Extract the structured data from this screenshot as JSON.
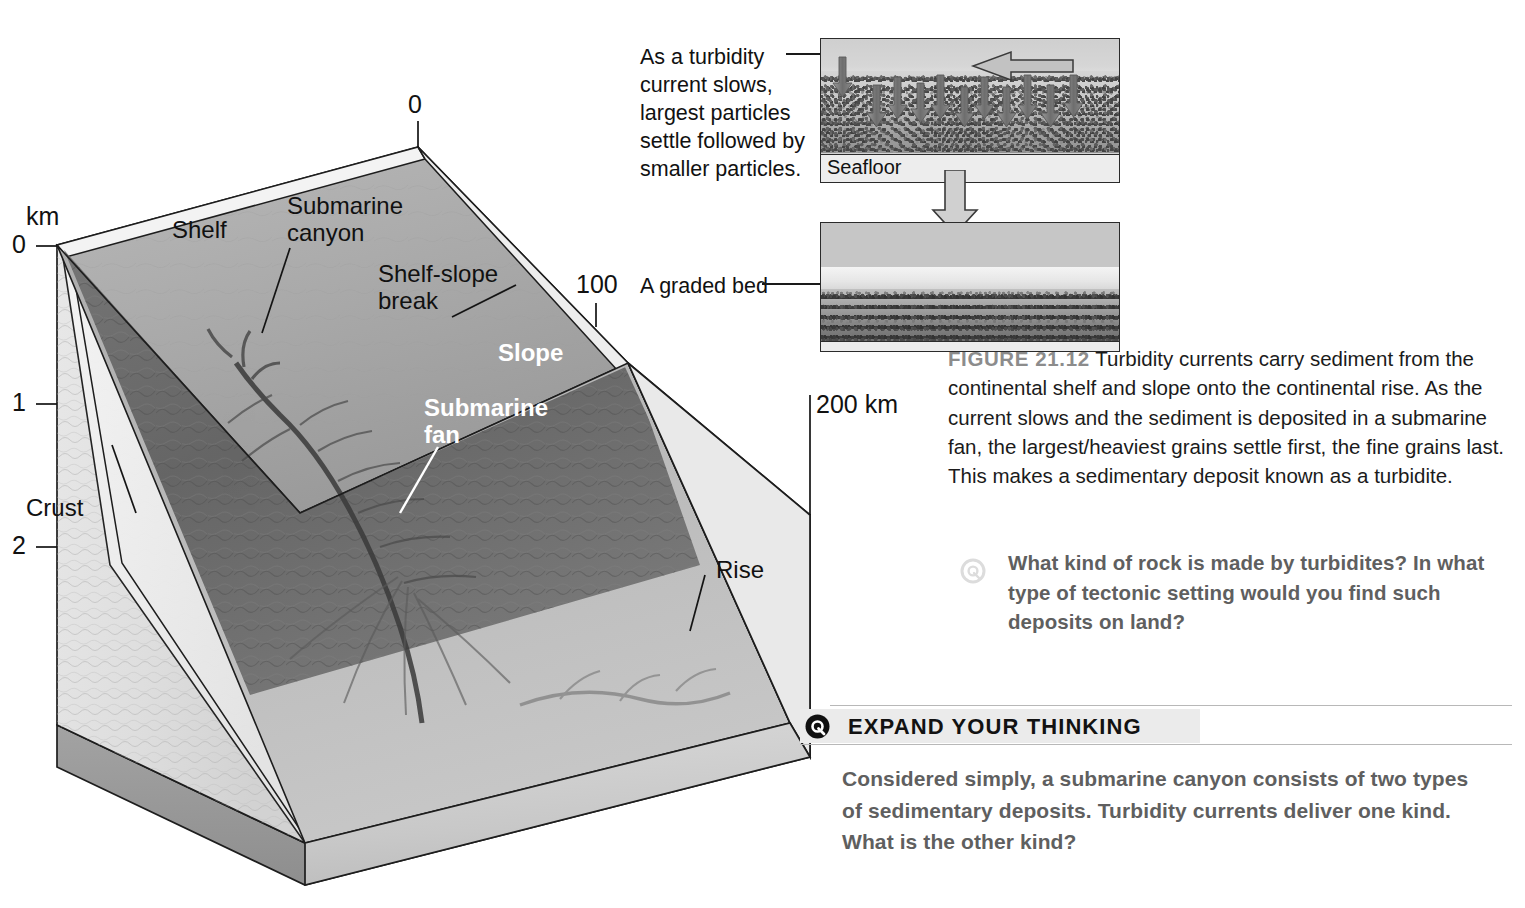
{
  "page": {
    "cutoff_text_fragment": ""
  },
  "block_diagram": {
    "name": "continental-margin-block-diagram",
    "depth_axis": {
      "unit_label": "km",
      "ticks": [
        "0",
        "1",
        "2"
      ]
    },
    "distance_ticks": {
      "origin": "0",
      "mid": "100",
      "end": "200 km"
    },
    "labels": {
      "shelf": "Shelf",
      "submarine_canyon_line1": "Submarine",
      "submarine_canyon_line2": "canyon",
      "shelf_slope_break_line1": "Shelf-slope",
      "shelf_slope_break_line2": "break",
      "slope": "Slope",
      "submarine_fan_line1": "Submarine",
      "submarine_fan_line2": "fan",
      "rise": "Rise",
      "crust": "Crust"
    }
  },
  "panels": {
    "turbidity_caption": "As a turbidity current slows, largest particles settle followed by smaller particles.",
    "turbidity_caption_lines": [
      "As a turbidity",
      "current slows,",
      "largest particles",
      "settle followed by",
      "smaller particles."
    ],
    "seafloor_label": "Seafloor",
    "graded_bed_caption": "A graded bed"
  },
  "figure_caption": {
    "figure_number": "FIGURE 21.12",
    "text": "Turbidity currents carry sediment from the continental shelf and slope onto the continental rise. As the current slows and the sediment is deposited in a submarine fan, the largest/heaviest grains settle first, the fine grains last. This makes a sedimentary deposit known as a turbidite."
  },
  "inline_question": {
    "icon": "question-circle-icon",
    "text": "What kind of rock is made by turbidites? In what type of tectonic setting would you find such deposits on land?"
  },
  "expand_your_thinking": {
    "icon": "question-circle-icon",
    "title": "EXPAND YOUR THINKING",
    "text": "Considered simply, a submarine canyon consists of two types of sedimentary deposits. Turbidity currents deliver one kind. What is the other kind?"
  },
  "colors": {
    "ink": "#111111",
    "figure_number_gray": "#8c8c8c",
    "question_gray": "#5f5f5f",
    "band_gray": "#ebebeb",
    "rule_gray": "#b8b8b8"
  }
}
